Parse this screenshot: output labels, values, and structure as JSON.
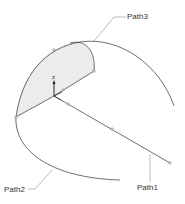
{
  "diagram": {
    "labels": {
      "path1": "Path1",
      "path2": "Path2",
      "path3": "Path3",
      "axis_z": "z"
    },
    "colors": {
      "curve": "#4a4a4a",
      "leader": "#8a8a8a",
      "fill": "#ececec",
      "text": "#333333",
      "background": "#ffffff"
    }
  }
}
